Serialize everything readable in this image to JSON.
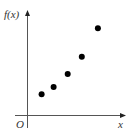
{
  "chart_data": {
    "type": "scatter",
    "title": "",
    "xlabel": "x",
    "ylabel": "f(x)",
    "origin_label": "O",
    "grid": false,
    "legend": null,
    "x_ticks": [],
    "y_ticks": [],
    "points": [
      {
        "x": 1.4,
        "y": 2.1
      },
      {
        "x": 2.6,
        "y": 2.8
      },
      {
        "x": 4.0,
        "y": 4.1
      },
      {
        "x": 5.4,
        "y": 5.8
      },
      {
        "x": 7.0,
        "y": 8.6
      }
    ],
    "xlim": [
      0,
      9.7
    ],
    "ylim": [
      0,
      10.4
    ],
    "note": "No numeric tick labels shown; values are relative positions estimated from pixel placement"
  },
  "colors": {
    "axis": "#555555",
    "points": "#000000",
    "background": "#ffffff"
  }
}
